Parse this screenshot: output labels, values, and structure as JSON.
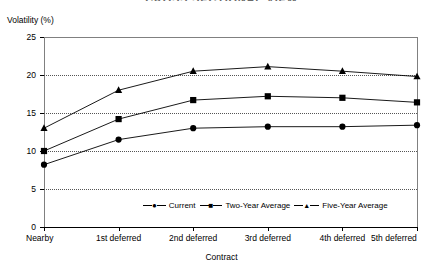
{
  "figure": {
    "title_cropped": "CROSS SECTIONAL VIEW",
    "y_axis_title": "Volatility (%)",
    "x_axis_title": "Contract"
  },
  "chart_data": {
    "type": "line",
    "title": "CROSS SECTIONAL VIEW",
    "xlabel": "Contract",
    "ylabel": "Volatility (%)",
    "categories": [
      "Nearby",
      "1st deferred",
      "2nd deferred",
      "3rd deferred",
      "4th deferred",
      "5th deferred"
    ],
    "ylim": [
      0,
      25
    ],
    "yticks": [
      0,
      5,
      10,
      15,
      20,
      25
    ],
    "ytick_labels": [
      "0",
      "5",
      "10",
      "15",
      "20",
      "25"
    ],
    "gridlines": [
      5,
      10,
      15,
      20
    ],
    "grid": true,
    "legend_position": "bottom-center",
    "series": [
      {
        "name": "Current",
        "marker": "circle",
        "values": [
          8.2,
          11.5,
          13.0,
          13.2,
          13.2,
          13.4
        ]
      },
      {
        "name": "Two-Year Average",
        "marker": "square",
        "values": [
          10.0,
          14.2,
          16.7,
          17.2,
          17.0,
          16.4
        ]
      },
      {
        "name": "Five-Year Average",
        "marker": "triangle",
        "values": [
          13.0,
          18.0,
          20.5,
          21.1,
          20.5,
          19.8
        ]
      }
    ]
  },
  "colors": {
    "line": "#000000",
    "marker": "#000000",
    "frame": "#808080",
    "grid": "#555555",
    "title": "#6a6a6a"
  }
}
